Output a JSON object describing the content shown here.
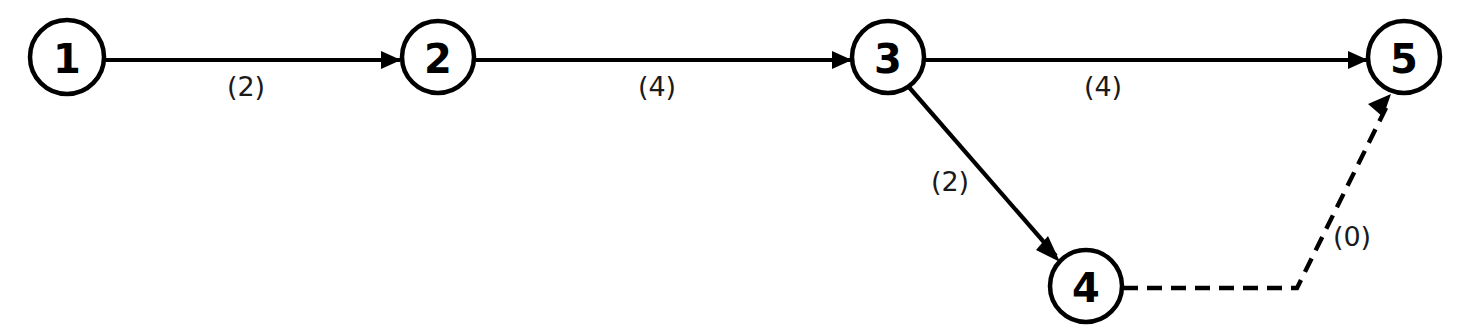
{
  "diagram": {
    "type": "activity-on-node network diagram",
    "title": "",
    "background_color": "#ffffff",
    "line_color": "#000000",
    "canvas": {
      "width": 1473,
      "height": 335
    },
    "nodes": [
      {
        "id": "1",
        "label": "1",
        "cx": 67,
        "cy": 57,
        "r": 37
      },
      {
        "id": "2",
        "label": "2",
        "cx": 438,
        "cy": 57,
        "r": 36
      },
      {
        "id": "3",
        "label": "3",
        "cx": 888,
        "cy": 57,
        "r": 36
      },
      {
        "id": "4",
        "label": "4",
        "cx": 1086,
        "cy": 286,
        "r": 36
      },
      {
        "id": "5",
        "label": "5",
        "cx": 1404,
        "cy": 57,
        "r": 36
      }
    ],
    "edges": [
      {
        "id": "e1",
        "from": "1",
        "to": "2",
        "label": "(2)",
        "weight": 2,
        "style": "solid",
        "arrow": true,
        "label_x": 246,
        "label_y": 86,
        "path": "M 104 60 L 400 60"
      },
      {
        "id": "e2",
        "from": "2",
        "to": "3",
        "label": "(4)",
        "weight": 4,
        "style": "solid",
        "arrow": true,
        "label_x": 657,
        "label_y": 86,
        "path": "M 474 60 L 851 60"
      },
      {
        "id": "e3",
        "from": "3",
        "to": "5",
        "label": "(4)",
        "weight": 4,
        "style": "solid",
        "arrow": true,
        "label_x": 1103,
        "label_y": 86,
        "path": "M 924 60 L 1367 60"
      },
      {
        "id": "e4",
        "from": "3",
        "to": "4",
        "label": "(2)",
        "weight": 2,
        "style": "solid",
        "arrow": true,
        "label_x": 950,
        "label_y": 181,
        "path": "M 908 86 L 1056 256"
      },
      {
        "id": "e5",
        "from": "4",
        "to": "5",
        "label": "(0)",
        "weight": 0,
        "style": "dashed",
        "arrow": true,
        "label_x": 1352,
        "label_y": 236,
        "path": "M 1123 288 L 1297 288 L 1387 106"
      }
    ]
  }
}
